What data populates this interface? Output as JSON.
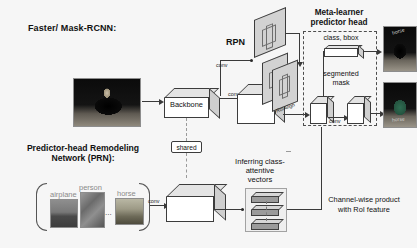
{
  "figure": {
    "title_left": "Faster/ Mask-RCNN:",
    "prn_title_line1": "Predictor-head Remodeling",
    "prn_title_line2": "Network (PRN):",
    "rpn_label": "RPN",
    "backbone_label": "Backbone",
    "shared_label": "shared",
    "meta_head_line1": "Meta-learner",
    "meta_head_line2": "predictor head",
    "class_bbox_label": "class, bbox",
    "seg_mask_line1": "segmented",
    "seg_mask_line2": "mask",
    "roialign_label": "RoIAlign",
    "inferring_line1": "Inferring class-",
    "inferring_line2": "attentive",
    "inferring_line3": "vectors",
    "channelwise_line1": "Channel-wise product",
    "channelwise_line2": "with RoI feature",
    "conv_labels": [
      "conv",
      "conv",
      "conv",
      "conv",
      "conv"
    ],
    "prn_class_labels": [
      "airplane",
      "person",
      "horse"
    ],
    "ellipsis": "...",
    "output_caption_1": "horse",
    "output_caption_2": "horse",
    "colors": {
      "background": "#f6f6f6",
      "stroke": "#3c3c3c",
      "cube_top": "#e4e4e4",
      "cube_side": "#cfcfcf",
      "dashed": "#4d4d4d",
      "vector_bar": "#9b9b9b",
      "photo_label": "#8a8a8a"
    }
  }
}
